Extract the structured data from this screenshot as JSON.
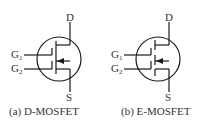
{
  "figures": [
    {
      "id": "a",
      "caption": "(a) D-MOSFET",
      "type": "depletion",
      "terminals": {
        "drain": "D",
        "source": "S",
        "gate1": "G",
        "gate1_sub": "1",
        "gate2": "G",
        "gate2_sub": "2"
      },
      "channel": "continuous"
    },
    {
      "id": "b",
      "caption": "(b) E-MOSFET",
      "type": "enhancement",
      "terminals": {
        "drain": "D",
        "source": "S",
        "gate1": "G",
        "gate1_sub": "1",
        "gate2": "G",
        "gate2_sub": "2"
      },
      "channel": "broken"
    }
  ],
  "colors": {
    "line": "#1a1a1a",
    "background": "#ffffff"
  }
}
